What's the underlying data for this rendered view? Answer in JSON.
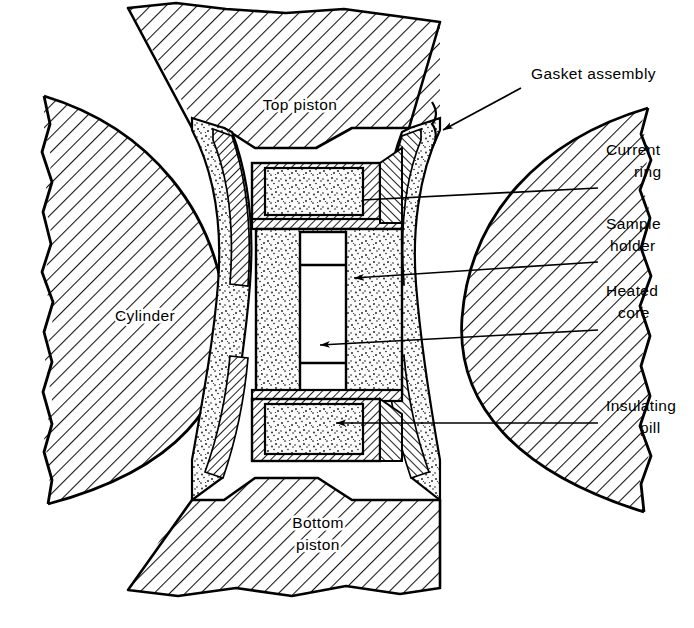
{
  "figure": {
    "background_color": "#ffffff",
    "line_color": "#000000",
    "hatch_color": "#1a1a1a",
    "stipple_color": "#2a2a2a",
    "width": 694,
    "height": 628
  },
  "internal_labels": [
    {
      "id": "top-piston",
      "text": "Top piston",
      "x": 300,
      "y": 110,
      "anchor": "middle"
    },
    {
      "id": "cylinder",
      "text": "Cylinder",
      "x": 145,
      "y": 321,
      "anchor": "middle"
    },
    {
      "id": "bottom-piston",
      "lines": [
        "Bottom",
        "piston"
      ],
      "x": 318,
      "y": 528,
      "anchor": "middle"
    }
  ],
  "callouts": [
    {
      "id": "gasket-assembly",
      "lines": [
        "Gasket assembly"
      ],
      "text_x": 531,
      "text_y": 79,
      "anchor": "start",
      "leader": {
        "type": "arrow",
        "points": "521,88 441,131"
      },
      "brace": true
    },
    {
      "id": "current-ring",
      "lines": [
        "Current",
        "ring"
      ],
      "text_x": 606,
      "text_y": 155,
      "anchor": "start",
      "leader": {
        "type": "line",
        "points": "598,188 360,200"
      }
    },
    {
      "id": "sample-holder",
      "lines": [
        "Sample",
        "holder"
      ],
      "text_x": 606,
      "text_y": 229,
      "anchor": "start",
      "leader": {
        "type": "arrow",
        "points": "598,262 352,278"
      }
    },
    {
      "id": "heated-core",
      "lines": [
        "Heated",
        "core"
      ],
      "text_x": 606,
      "text_y": 296,
      "anchor": "start",
      "leader": {
        "type": "arrow",
        "points": "598,330 318,345"
      }
    },
    {
      "id": "insulating-pill",
      "lines": [
        "Insulating",
        "pill"
      ],
      "text_x": 606,
      "text_y": 411,
      "anchor": "start",
      "leader": {
        "type": "arrow",
        "points": "598,423 334,423"
      }
    }
  ],
  "parts": {
    "top_piston": {
      "name": "Top piston",
      "fill": "hatch-45"
    },
    "bottom_piston": {
      "name": "Bottom piston",
      "fill": "hatch-45"
    },
    "left_cylinder": {
      "name": "Cylinder",
      "fill": "hatch-45"
    },
    "right_cylinder": {
      "name": "Cylinder",
      "fill": "hatch-45"
    },
    "gasket": {
      "name": "Gasket assembly",
      "fill": "stipple"
    },
    "current_ring": {
      "name": "Current ring",
      "fill": "hatch-fine"
    },
    "sample_holder": {
      "name": "Sample holder",
      "fill": "stipple"
    },
    "heated_core": {
      "name": "Heated core",
      "fill": "white"
    },
    "insulating_pill": {
      "name": "Insulating pill",
      "fill": "stipple"
    }
  }
}
